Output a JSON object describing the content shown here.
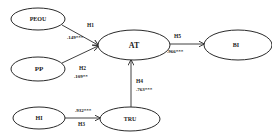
{
  "diagram": {
    "type": "structural-model",
    "colors": {
      "stroke": "#2a2a2a",
      "text": "#222222",
      "background": "#ffffff"
    },
    "nodes": [
      {
        "id": "PEOU",
        "label": "PEOU",
        "cx": 38,
        "cy": 19,
        "rx": 27,
        "ry": 11
      },
      {
        "id": "PP",
        "label": "PP",
        "cx": 38,
        "cy": 69,
        "rx": 27,
        "ry": 12
      },
      {
        "id": "HI",
        "label": "HI",
        "cx": 39,
        "cy": 118,
        "rx": 26,
        "ry": 11
      },
      {
        "id": "AT",
        "label": "AT",
        "cx": 134,
        "cy": 45,
        "rx": 36,
        "ry": 15
      },
      {
        "id": "BI",
        "label": "BI",
        "cx": 238,
        "cy": 45,
        "rx": 34,
        "ry": 15
      },
      {
        "id": "TRU",
        "label": "TRU",
        "cx": 130,
        "cy": 119,
        "rx": 30,
        "ry": 12
      }
    ],
    "edges": [
      {
        "from": "PEOU",
        "to": "AT",
        "hypothesis": "H1",
        "coefficient": ".149***"
      },
      {
        "from": "PP",
        "to": "AT",
        "hypothesis": "H2",
        "coefficient": ".109**"
      },
      {
        "from": "HI",
        "to": "TRU",
        "hypothesis": "H3",
        "coefficient": ".932***"
      },
      {
        "from": "TRU",
        "to": "AT",
        "hypothesis": "H4",
        "coefficient": ".763***"
      },
      {
        "from": "AT",
        "to": "BI",
        "hypothesis": "H5",
        "coefficient": ".966***"
      }
    ]
  }
}
